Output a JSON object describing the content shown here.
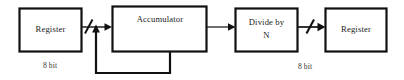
{
  "diagram": {
    "background_color": "#ffffff",
    "line_color": "#111111",
    "text_color": "#1a1a1a",
    "blocks": [
      {
        "id": "input-register",
        "label": "Register",
        "label_line1": "Register",
        "label_line2": "",
        "x": 19,
        "y": 8,
        "w": 63,
        "h": 44
      },
      {
        "id": "accumulator",
        "label": "Accumulator",
        "label_line1": "Accumulator",
        "label_line2": "",
        "x": 112,
        "y": 6,
        "w": 95,
        "h": 46
      },
      {
        "id": "divide-by-n",
        "label": "Divide by N",
        "label_line1": "Divide by",
        "label_line2": "N",
        "x": 235,
        "y": 8,
        "w": 63,
        "h": 44
      },
      {
        "id": "output-register",
        "label": "Register",
        "label_line1": "Register",
        "label_line2": "",
        "x": 325,
        "y": 8,
        "w": 62,
        "h": 44
      }
    ],
    "wire_labels": [
      {
        "id": "left-bus-width",
        "text": "8 bit",
        "x": 50,
        "y": 66
      },
      {
        "id": "right-bus-width",
        "text": "8 bit",
        "x": 305,
        "y": 67
      }
    ],
    "connections": [
      {
        "id": "register-to-accumulator",
        "from": "input-register",
        "to": "accumulator",
        "bus_width": "8 bit",
        "slashed": true
      },
      {
        "id": "accumulator-to-divider",
        "from": "accumulator",
        "to": "divide-by-n",
        "bus_width": "",
        "slashed": false
      },
      {
        "id": "divider-to-register",
        "from": "divide-by-n",
        "to": "output-register",
        "bus_width": "8 bit",
        "slashed": true
      },
      {
        "id": "accumulator-feedback",
        "from": "accumulator",
        "to": "accumulator-input-node",
        "bus_width": "",
        "slashed": false
      }
    ]
  }
}
